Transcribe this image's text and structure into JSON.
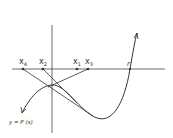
{
  "diagram": {
    "curve_label": "y = P (x)",
    "root_label": "r",
    "points": [
      {
        "name": "x4",
        "base": "x",
        "sub": "4"
      },
      {
        "name": "x2",
        "base": "x",
        "sub": "2"
      },
      {
        "name": "x1",
        "base": "x",
        "sub": "1"
      },
      {
        "name": "x3",
        "base": "x",
        "sub": "3"
      }
    ],
    "colors": {
      "line": "#333333",
      "background": "#ffffff"
    }
  }
}
